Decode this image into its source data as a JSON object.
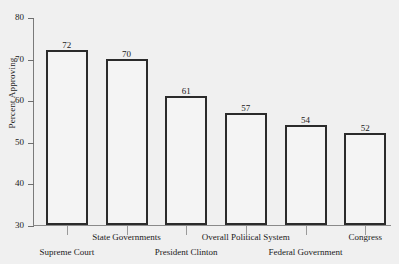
{
  "chart_data": {
    "type": "bar",
    "title": "",
    "subtitle": "",
    "xlabel": "",
    "ylabel": "Percent Approving",
    "ylim": [
      30,
      80
    ],
    "yticks": [
      30,
      40,
      50,
      60,
      70,
      80
    ],
    "grid": false,
    "legend": false,
    "categories": [
      "Supreme Court",
      "State Governments",
      "President Clinton",
      "Overall Political System",
      "Federal Government",
      "Congress"
    ],
    "values": [
      72,
      70,
      61,
      57,
      54,
      52
    ],
    "value_labels": [
      "72",
      "70",
      "61",
      "57",
      "54",
      "52"
    ],
    "label_rows": [
      "bottom",
      "top",
      "bottom",
      "top",
      "bottom",
      "top"
    ],
    "bar_style": {
      "fill": "#f4f4f4",
      "border": "#2b2b2b"
    },
    "background": "#f0f0f0"
  }
}
